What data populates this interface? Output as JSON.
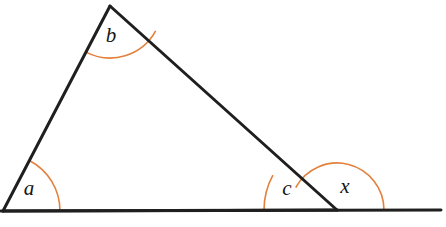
{
  "figure": {
    "background_color": "#ffffff",
    "line_color": "#1f1f1f",
    "arc_color": "#e3803c",
    "label_color": "#151515",
    "line_width": 3,
    "arc_width": 1.6
  },
  "vertices": {
    "left": {
      "name": "A",
      "x": 3,
      "y": 211
    },
    "apex": {
      "name": "B",
      "x": 110,
      "y": 6
    },
    "right": {
      "name": "C",
      "x": 337,
      "y": 210
    }
  },
  "baseline": {
    "name": "extended-base-line",
    "x1": 1,
    "y1": 211,
    "x2": 441,
    "y2": 210
  },
  "segments": [
    {
      "name": "side-left",
      "from": "left",
      "to": "apex"
    },
    {
      "name": "side-hypotenuse",
      "from": "apex",
      "to": "right"
    },
    {
      "name": "side-base",
      "from": "left",
      "to": "right"
    }
  ],
  "angles": [
    {
      "id": "a",
      "label": "a",
      "name": "angle-a-arc",
      "vertex": "left",
      "kind": "interior",
      "radius": 57,
      "start_deg": 0,
      "end_deg": 62.5,
      "label_x": 29,
      "label_y": 190
    },
    {
      "id": "b",
      "label": "b",
      "name": "angle-b-arc",
      "vertex": "apex",
      "kind": "interior",
      "radius": 52,
      "start_deg": 242.5,
      "end_deg": 331.4,
      "label_x": 111,
      "label_y": 37
    },
    {
      "id": "c",
      "label": "c",
      "name": "angle-c-arc",
      "vertex": "right",
      "kind": "interior",
      "radius": 73,
      "start_deg": 151.4,
      "end_deg": 180,
      "label_x": 287,
      "label_y": 190
    },
    {
      "id": "x",
      "label": "x",
      "name": "angle-x-arc",
      "vertex": "right",
      "kind": "exterior",
      "radius": 47,
      "start_deg": 0,
      "end_deg": 151.4,
      "label_x": 345,
      "label_y": 188
    }
  ]
}
